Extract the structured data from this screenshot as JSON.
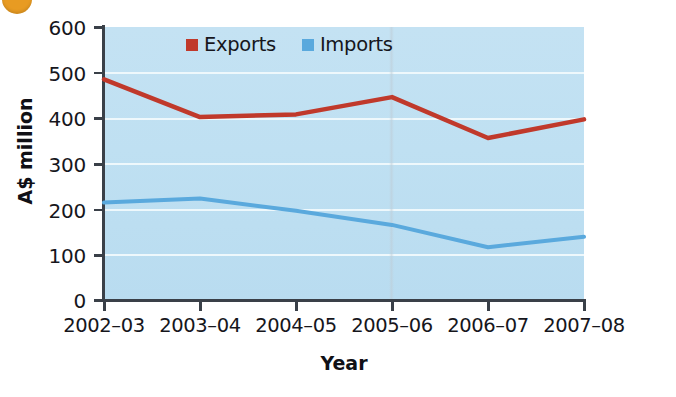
{
  "chart_data": {
    "type": "line",
    "title": "",
    "xlabel": "Year",
    "ylabel": "A$ million",
    "categories": [
      "2002–03",
      "2003–04",
      "2004–05",
      "2005–06",
      "2006–07",
      "2007–08"
    ],
    "series": [
      {
        "name": "Exports",
        "color": "#c0392b",
        "values": [
          485,
          402,
          408,
          446,
          356,
          397
        ]
      },
      {
        "name": "Imports",
        "color": "#5aa9dd",
        "values": [
          214,
          223,
          196,
          165,
          116,
          139
        ]
      }
    ],
    "ylim": [
      0,
      600
    ],
    "y_ticks": [
      0,
      100,
      200,
      300,
      400,
      500,
      600
    ],
    "y_tick_labels": [
      "0",
      "100",
      "200",
      "300",
      "400",
      "500",
      "600"
    ],
    "grid": "horizontal",
    "legend_position": "top-center",
    "plot_background": "#c0e0f2"
  },
  "legend": {
    "items": [
      {
        "label": "Exports",
        "color": "#c0392b"
      },
      {
        "label": "Imports",
        "color": "#5aa9dd"
      }
    ]
  },
  "axes": {
    "y_title": "A$ million",
    "x_title": "Year"
  },
  "decoration": {
    "corner_badge_color": "#e89b22"
  }
}
